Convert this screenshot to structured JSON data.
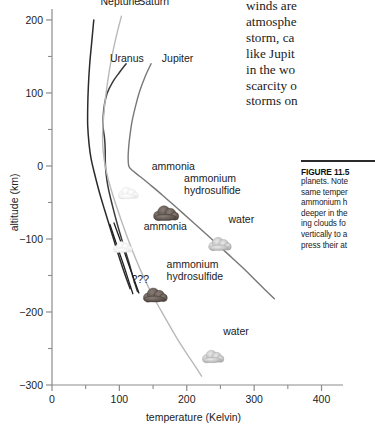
{
  "chart_data": {
    "type": "line",
    "title": "",
    "xlabel": "temperature (Kelvin)",
    "ylabel": "altitude (km)",
    "xlim": [
      0,
      420
    ],
    "ylim": [
      -300,
      215
    ],
    "xticks": [
      0,
      100,
      200,
      300,
      400
    ],
    "xtick_labels": [
      "0",
      "100",
      "200",
      "300",
      "400"
    ],
    "xminor": [
      50,
      150,
      250,
      350
    ],
    "yticks": [
      200,
      100,
      0,
      -100,
      -200,
      -300
    ],
    "ytick_labels": [
      "200",
      "100",
      "0",
      "−100",
      "−200",
      "−300"
    ],
    "yminor": [
      150,
      50,
      -50,
      -150,
      -250
    ],
    "grid": false,
    "legend_position": "inline-curve-labels",
    "series": [
      {
        "name": "Neptune",
        "color": "#2b2b2b",
        "width": 1.5,
        "label": "Neptune",
        "label_x": 72,
        "label_y": 220,
        "points": [
          [
            62,
            200
          ],
          [
            59,
            170
          ],
          [
            56,
            140
          ],
          [
            54,
            110
          ],
          [
            53,
            80
          ],
          [
            53,
            55
          ],
          [
            55,
            30
          ],
          [
            58,
            10
          ],
          [
            63,
            -10
          ],
          [
            70,
            -35
          ],
          [
            78,
            -60
          ],
          [
            88,
            -90
          ],
          [
            98,
            -120
          ],
          [
            108,
            -148
          ],
          [
            116,
            -168
          ]
        ]
      },
      {
        "name": "Uranus",
        "color": "#3a3a3a",
        "width": 1.5,
        "label": "Uranus",
        "label_x": 86,
        "label_y": 143,
        "points": [
          [
            110,
            140
          ],
          [
            100,
            128
          ],
          [
            90,
            115
          ],
          [
            82,
            100
          ],
          [
            78,
            85
          ],
          [
            76,
            68
          ],
          [
            76,
            52
          ],
          [
            78,
            38
          ],
          [
            79,
            22
          ],
          [
            79,
            8
          ],
          [
            80,
            -8
          ],
          [
            83,
            -28
          ],
          [
            89,
            -52
          ],
          [
            97,
            -80
          ],
          [
            106,
            -108
          ],
          [
            115,
            -135
          ],
          [
            122,
            -158
          ],
          [
            127,
            -172
          ]
        ]
      },
      {
        "name": "Saturn",
        "color": "#b9b9b9",
        "width": 1.4,
        "label": "Saturn",
        "label_x": 128,
        "label_y": 220,
        "points": [
          [
            103,
            205
          ],
          [
            96,
            180
          ],
          [
            90,
            155
          ],
          [
            85,
            130
          ],
          [
            81,
            105
          ],
          [
            78,
            82
          ],
          [
            76,
            60
          ],
          [
            75,
            40
          ],
          [
            76,
            20
          ],
          [
            79,
            0
          ],
          [
            84,
            -20
          ],
          [
            92,
            -45
          ],
          [
            103,
            -75
          ],
          [
            116,
            -108
          ],
          [
            131,
            -142
          ],
          [
            148,
            -175
          ],
          [
            166,
            -205
          ],
          [
            188,
            -240
          ],
          [
            208,
            -268
          ],
          [
            222,
            -288
          ]
        ]
      },
      {
        "name": "Jupiter",
        "color": "#777777",
        "width": 1.4,
        "label": "Jupiter",
        "label_x": 163,
        "label_y": 143,
        "points": [
          [
            147,
            140
          ],
          [
            138,
            122
          ],
          [
            130,
            102
          ],
          [
            124,
            82
          ],
          [
            119,
            62
          ],
          [
            116,
            44
          ],
          [
            114,
            28
          ],
          [
            113,
            12
          ],
          [
            114,
            0
          ],
          [
            119,
            -6
          ],
          [
            130,
            -14
          ],
          [
            146,
            -26
          ],
          [
            164,
            -40
          ],
          [
            186,
            -58
          ],
          [
            208,
            -76
          ],
          [
            232,
            -96
          ],
          [
            258,
            -118
          ],
          [
            284,
            -140
          ],
          [
            308,
            -162
          ],
          [
            330,
            -182
          ]
        ]
      },
      {
        "name": "Unknown-deep-branch-a",
        "color": "#1f1f1f",
        "width": 1.3,
        "label": "???",
        "label_x": 118,
        "label_y": -160,
        "points": [
          [
            86,
            -80
          ],
          [
            96,
            -108
          ],
          [
            106,
            -135
          ],
          [
            114,
            -158
          ],
          [
            120,
            -175
          ]
        ]
      },
      {
        "name": "Unknown-deep-branch-b",
        "color": "#1f1f1f",
        "width": 1.3,
        "label": "",
        "label_x": 0,
        "label_y": 0,
        "points": [
          [
            92,
            -78
          ],
          [
            103,
            -106
          ],
          [
            113,
            -133
          ],
          [
            122,
            -156
          ],
          [
            129,
            -174
          ]
        ]
      }
    ],
    "cloud_markers": [
      {
        "species": "ammonia",
        "label": "ammonia",
        "x": 112,
        "y": -38,
        "tone": "pale",
        "size": 16,
        "label_x": 148,
        "label_y": -5,
        "label_anchor": "start"
      },
      {
        "species": "ammonium hydrosulfide",
        "label": "ammonium\nhydrosulfide",
        "x": 168,
        "y": -66,
        "tone": "dark",
        "size": 20,
        "label_x": 196,
        "label_y": -22,
        "label_anchor": "start"
      },
      {
        "species": "water",
        "label": "water",
        "x": 248,
        "y": -108,
        "tone": "mid",
        "size": 18,
        "label_x": 262,
        "label_y": -78,
        "label_anchor": "start"
      },
      {
        "species": "ammonia",
        "label": "ammonia",
        "x": 104,
        "y": -112,
        "tone": "pale",
        "size": 15,
        "label_x": 136,
        "label_y": -88,
        "label_anchor": "start"
      },
      {
        "species": "ammonium hydrosulfide",
        "label": "ammonium\nhydrosulfide",
        "x": 152,
        "y": -178,
        "tone": "dark",
        "size": 19,
        "label_x": 170,
        "label_y": -140,
        "label_anchor": "start"
      },
      {
        "species": "water",
        "label": "water",
        "x": 238,
        "y": -262,
        "tone": "mid",
        "size": 17,
        "label_x": 254,
        "label_y": -232,
        "label_anchor": "start"
      }
    ]
  },
  "body_text": {
    "lines": [
      "winds are",
      "atmosphe",
      "storm, ca",
      "like Jupit",
      "in the wo",
      "scarcity o",
      "storms on"
    ]
  },
  "caption": {
    "heading": "FIGURE 11.5",
    "lines": [
      "planets. Note",
      "same temper",
      "ammonium h",
      "deeper in the",
      "ing clouds fo",
      "vertically to a",
      "press their at"
    ]
  }
}
